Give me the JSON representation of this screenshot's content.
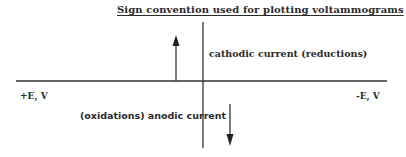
{
  "title": "Sign convention used for plotting voltammograms",
  "axes": {
    "left_label": "+E, V",
    "right_label": "-E, V"
  },
  "annotations": {
    "cathodic": "cathodic current (reductions)",
    "anodic": "(oxidations) anodic current"
  },
  "arrows": [
    {
      "name": "cathodic-current-arrow",
      "direction": "up"
    },
    {
      "name": "anodic-current-arrow",
      "direction": "down"
    }
  ],
  "colors": {
    "ink": "#2a2a2a",
    "background": "#ffffff"
  }
}
